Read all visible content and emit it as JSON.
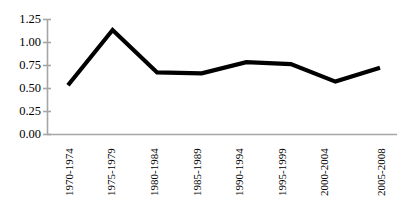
{
  "chart_data": {
    "type": "line",
    "title": "",
    "subtitle": "",
    "xlabel": "",
    "ylabel": "",
    "categories": [
      "1970-1974",
      "1975-1979",
      "1980-1984",
      "1985-1989",
      "1990-1994",
      "1995-1999",
      "2000-2004",
      "2005-2008"
    ],
    "values": [
      0.53,
      1.13,
      0.67,
      0.66,
      0.78,
      0.76,
      0.57,
      0.72
    ],
    "series": [
      {
        "name": "series-1",
        "values": [
          0.53,
          1.13,
          0.67,
          0.66,
          0.78,
          0.76,
          0.57,
          0.72
        ],
        "color": "#000000"
      }
    ],
    "ylim": [
      0.0,
      1.25
    ],
    "yticks": [
      0.0,
      0.25,
      0.5,
      0.75,
      1.0,
      1.25
    ],
    "ytick_labels": [
      "0.00",
      "0.25",
      "0.50",
      "0.75",
      "1.00",
      "1.25"
    ],
    "grid": false,
    "legend": false,
    "legend_position": "none",
    "axis_color": "#a6a6a6",
    "line_color": "#000000",
    "background": "#ffffff"
  }
}
